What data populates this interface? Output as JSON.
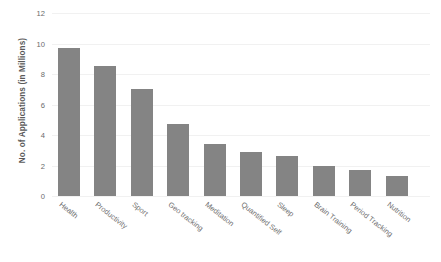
{
  "chart_data": {
    "type": "bar",
    "title": "",
    "xlabel": "",
    "ylabel": "No. of Applications (in Millions)",
    "ylim": [
      0,
      12
    ],
    "yticks": [
      0,
      2,
      4,
      6,
      8,
      10,
      12
    ],
    "ytick_labels": [
      "0",
      "2",
      "4",
      "6",
      "8",
      "10",
      "12"
    ],
    "grid": true,
    "legend": "none",
    "bar_color": "#848484",
    "categories": [
      "Health",
      "Productivity",
      "Sport",
      "Geo tracking",
      "Meditation",
      "Quantified Self",
      "Sleep",
      "Brain Training",
      "Period Tracking",
      "Nutrition"
    ],
    "values": [
      9.7,
      8.5,
      7.0,
      4.7,
      3.4,
      2.9,
      2.6,
      2.0,
      1.7,
      1.3
    ]
  }
}
